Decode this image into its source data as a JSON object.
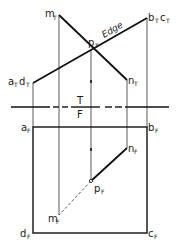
{
  "diagram": {
    "type": "descriptive-geometry-projection",
    "fold_line": {
      "top_label": "T",
      "bottom_label": "F"
    },
    "edge_label": "Edge",
    "top_view": {
      "labels": {
        "ad": {
          "a": "a",
          "a_sub": "T",
          "d": "d",
          "d_sub": "T"
        },
        "bc": {
          "b": "b",
          "b_sub": "T",
          "c": "c",
          "c_sub": "T"
        },
        "m": {
          "main": "m",
          "sub": "T"
        },
        "n": {
          "main": "n",
          "sub": "T"
        },
        "p": {
          "main": "p",
          "sub": "T"
        }
      }
    },
    "front_view": {
      "labels": {
        "a": {
          "main": "a",
          "sub": "F"
        },
        "b": {
          "main": "b",
          "sub": "F"
        },
        "c": {
          "main": "c",
          "sub": "F"
        },
        "d": {
          "main": "d",
          "sub": "F"
        },
        "m": {
          "main": "m",
          "sub": "F"
        },
        "n": {
          "main": "n",
          "sub": "F"
        },
        "p": {
          "main": "p",
          "sub": "F"
        }
      }
    },
    "colors": {
      "line": "#1a1a1a",
      "background": "#ffffff"
    }
  }
}
